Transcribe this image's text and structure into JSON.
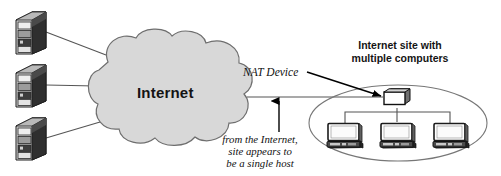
{
  "figure": {
    "kind": "network-diagram",
    "width": 501,
    "height": 176,
    "background": "#ffffff"
  },
  "labels": {
    "cloud": "Internet",
    "site_line1": "Internet site with",
    "site_line2": "multiple computers",
    "nat_device": "NAT Device",
    "note_line1": "from the Internet,",
    "note_line2": "site appears to",
    "note_line3": "be a single host"
  },
  "nodes": {
    "servers": [
      {
        "name": "server-top",
        "x": 14,
        "y": 10
      },
      {
        "name": "server-middle",
        "x": 14,
        "y": 63
      },
      {
        "name": "server-bottom",
        "x": 14,
        "y": 116
      }
    ],
    "cloud": {
      "name": "internet-cloud",
      "cx": 168,
      "cy": 92
    },
    "nat": {
      "name": "nat-device",
      "x": 382,
      "y": 88
    },
    "site_ellipse": {
      "name": "site-boundary-ellipse",
      "cx": 398,
      "cy": 123,
      "rx": 89,
      "ry": 38
    },
    "workstations": [
      {
        "name": "workstation-left",
        "x": 326,
        "y": 122
      },
      {
        "name": "workstation-center",
        "x": 380,
        "y": 122
      },
      {
        "name": "workstation-right",
        "x": 434,
        "y": 122
      }
    ]
  },
  "colors": {
    "cloud_fill": "#d8d8d8",
    "cloud_stroke": "#6e6e6e",
    "line": "#555555",
    "arrow": "#000000",
    "ellipse_stroke": "#777777",
    "server_dark": "#2b2b2b",
    "server_mid": "#8f8f8f",
    "server_light": "#d5d5d5",
    "monitor_screen": "#ffffff",
    "monitor_frame": "#1c1c1c",
    "monitor_base": "#3a3a3a",
    "text": "#141414"
  }
}
